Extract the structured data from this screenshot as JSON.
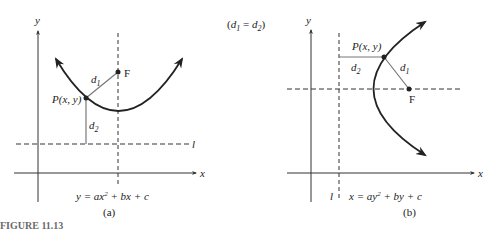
{
  "figure": {
    "caption": "FIGURE 11.13",
    "relation_note": "(d1 = d2)",
    "relation_parts": {
      "open": "(",
      "d1": "d",
      "sub1": "1",
      "eq": " = ",
      "d2": "d",
      "sub2": "2",
      "close": ")"
    }
  },
  "panel_a": {
    "sublabel": "(a)",
    "axis_x": "x",
    "axis_y": "y",
    "focus_label": "F",
    "point_label": "P(x, y)",
    "d1_label": "d",
    "d1_sub": "1",
    "d2_label": "d",
    "d2_sub": "2",
    "directrix_label": "l",
    "equation": {
      "lhs": "y = ax",
      "exp": "2",
      "rhs": " + bx + c"
    },
    "orientation": "opens upward"
  },
  "panel_b": {
    "sublabel": "(b)",
    "axis_x": "x",
    "axis_y": "y",
    "focus_label": "F",
    "point_label": "P(x, y)",
    "d1_label": "d",
    "d1_sub": "1",
    "d2_label": "d",
    "d2_sub": "2",
    "directrix_label": "l",
    "equation": {
      "lhs": "x = ay",
      "exp": "2",
      "rhs": " + by + c"
    },
    "orientation": "opens rightward"
  },
  "colors": {
    "curve": "#222222",
    "axis": "#333333",
    "segment": "#777777",
    "caption": "#6a6a6a"
  }
}
